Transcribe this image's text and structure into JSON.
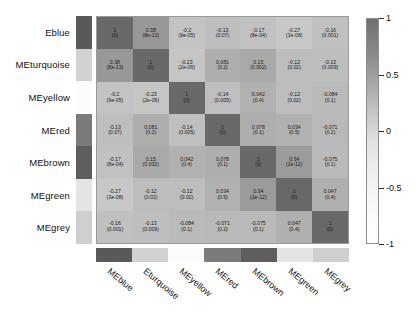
{
  "chart_data": {
    "type": "heatmap",
    "title": "",
    "xlabel": "",
    "ylabel": "",
    "row_labels": [
      "Eblue",
      "MEturquoise",
      "MEyellow",
      "MEred",
      "MEbrown",
      "MEgreen",
      "MEgrey"
    ],
    "col_labels": [
      "MEblue",
      "Eturquoise",
      "MEyellow",
      "MEred",
      "MEbrown",
      "MEgreen",
      "MEgrey"
    ],
    "module_colors": [
      "#595959",
      "#d2d2d2",
      "#fbfbfb",
      "#7b7b7b",
      "#5e5e5e",
      "#e4e4e4",
      "#cfcfcf"
    ],
    "zlim": [
      -1,
      1
    ],
    "colorbar": {
      "ticks": [
        "1",
        "0.5",
        "0",
        "-0.5",
        "-1"
      ],
      "tick_values": [
        1,
        0.5,
        0,
        -0.5,
        -1
      ],
      "position": "right",
      "low_color": "#ffffff",
      "high_color": "#6f6f6f"
    },
    "values": [
      [
        1,
        0.38,
        -0.2,
        -0.13,
        -0.17,
        -0.27,
        -0.16
      ],
      [
        0.38,
        1,
        -0.23,
        0.081,
        0.15,
        -0.12,
        -0.13
      ],
      [
        -0.2,
        -0.23,
        1,
        -0.14,
        0.042,
        -0.12,
        -0.084
      ],
      [
        -0.13,
        0.081,
        -0.14,
        1,
        0.078,
        0.034,
        -0.071
      ],
      [
        -0.17,
        0.15,
        0.042,
        0.078,
        1,
        0.34,
        -0.075
      ],
      [
        -0.27,
        -0.12,
        -0.12,
        0.034,
        0.34,
        1,
        0.047
      ],
      [
        -0.16,
        -0.13,
        -0.084,
        -0.071,
        -0.075,
        0.047,
        1
      ]
    ],
    "pvalues": [
      [
        "0",
        "8e-13",
        "9e-05",
        "0.07",
        "8e-04",
        "3e-08",
        "0.001"
      ],
      [
        "8e-13",
        "0",
        "2e-06",
        "0.2",
        "0.002",
        "0.02",
        "0.009"
      ],
      [
        "9e-05",
        "2e-06",
        "0",
        "0.005",
        "0.4",
        "0.02",
        "0.1"
      ],
      [
        "0.07",
        "0.2",
        "0.005",
        "0",
        "0.1",
        "0.5",
        "0.2"
      ],
      [
        "8e-04",
        "0.002",
        "0.4",
        "0.1",
        "0",
        "2e-12",
        "0.1"
      ],
      [
        "3e-08",
        "0.02",
        "0.02",
        "0.5",
        "2e-12",
        "0",
        "0.4"
      ],
      [
        "0.001",
        "0.009",
        "0.1",
        "0.2",
        "0.1",
        "0.4",
        "0"
      ]
    ],
    "cell_labels": [
      [
        "1",
        "0.38",
        "-0.2",
        "-0.13",
        "-0.17",
        "-0.27",
        "-0.16"
      ],
      [
        "0.38",
        "1",
        "-0.23",
        "0.081",
        "0.15",
        "-0.12",
        "-0.13"
      ],
      [
        "-0.2",
        "-0.23",
        "1",
        "-0.14",
        "0.042",
        "-0.12",
        "-0.084"
      ],
      [
        "-0.13",
        "0.081",
        "-0.14",
        "1",
        "0.078",
        "0.034",
        "-0.071"
      ],
      [
        "-0.17",
        "0.15",
        "0.042",
        "0.078",
        "1",
        "0.34",
        "-0.075"
      ],
      [
        "-0.27",
        "-0.12",
        "-0.12",
        "0.034",
        "0.34",
        "1",
        "0.047"
      ],
      [
        "-0.16",
        "-0.13",
        "-0.084",
        "-0.071",
        "-0.075",
        "0.047",
        "1"
      ]
    ]
  }
}
